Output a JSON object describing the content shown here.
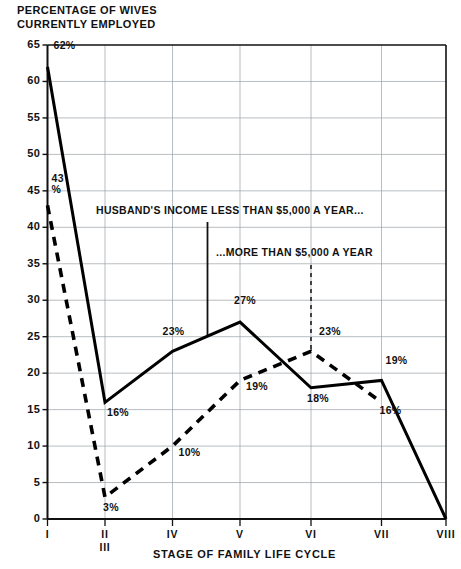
{
  "chart_data": {
    "type": "line",
    "title": "PERCENTAGE OF WIVES\nCURRENTLY EMPLOYED",
    "xlabel": "STAGE OF FAMILY LIFE CYCLE",
    "ylabel": "PERCENTAGE OF WIVES CURRENTLY EMPLOYED",
    "ylim": [
      0,
      65
    ],
    "ytick_step": 5,
    "yticks": [
      "65",
      "60",
      "55",
      "50",
      "45",
      "40",
      "35",
      "30",
      "25",
      "20",
      "15",
      "10",
      "5",
      "0"
    ],
    "categories": [
      "I",
      "II",
      "IV",
      "V",
      "VI",
      "VII",
      "VIII"
    ],
    "xtick_labels": [
      {
        "top": "I",
        "bottom": ""
      },
      {
        "top": "II",
        "bottom": "III"
      },
      {
        "top": "IV",
        "bottom": ""
      },
      {
        "top": "V",
        "bottom": ""
      },
      {
        "top": "VI",
        "bottom": ""
      },
      {
        "top": "VII",
        "bottom": ""
      },
      {
        "top": "VIII",
        "bottom": ""
      }
    ],
    "grid": true,
    "legend_position": "inline-annotations",
    "series": [
      {
        "name": "HUSBAND'S INCOME LESS THAN $5,000 A YEAR...",
        "style": "solid",
        "color": "#000000",
        "x": [
          "I",
          "II",
          "IV",
          "V",
          "VI",
          "VII",
          "VIII"
        ],
        "values": [
          62,
          16,
          23,
          27,
          18,
          19,
          0
        ],
        "point_labels": [
          "62%",
          "16%",
          "23%",
          "27%",
          "18%",
          "19%",
          ""
        ]
      },
      {
        "name": "...MORE THAN $5,000 A YEAR",
        "style": "dashed",
        "color": "#000000",
        "x": [
          "I",
          "II",
          "IV",
          "V",
          "VI",
          "VII"
        ],
        "values": [
          43,
          3,
          10,
          19,
          23,
          16
        ],
        "point_labels": [
          "43\n%",
          "3%",
          "10%",
          "19%",
          "23%",
          "16%"
        ]
      }
    ],
    "annotations": [
      {
        "text": "HUSBAND'S INCOME LESS THAN $5,000 A YEAR...",
        "leader": "solid"
      },
      {
        "text": "...MORE THAN $5,000 A YEAR",
        "leader": "dashed"
      }
    ]
  }
}
